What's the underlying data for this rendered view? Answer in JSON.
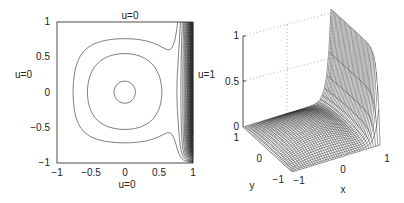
{
  "chart_data": [
    {
      "type": "contour",
      "title": "",
      "xlabel": "",
      "ylabel": "",
      "xlim": [
        -1,
        1
      ],
      "ylim": [
        -1,
        1
      ],
      "xticks": [
        "−1",
        "−0.5",
        "0",
        "0.5",
        "1"
      ],
      "yticks": [
        "−1",
        "−0.5",
        "0",
        "0.5",
        "1"
      ],
      "boundary_labels": {
        "top": "u = 0",
        "bottom": "u = 0",
        "left": "u = 0",
        "right": "u = 1"
      },
      "description": "Contour plot of the solution u(x,y) on [-1,1]^2 with u=1 on the right edge x=1 and u=0 elsewhere; contours crowd along the right and bottom-right boundary layers."
    },
    {
      "type": "surface",
      "title": "",
      "xlabel": "x",
      "ylabel": "y",
      "zlabel": "",
      "xlim": [
        -1,
        1
      ],
      "ylim": [
        -1,
        1
      ],
      "zlim": [
        0,
        1
      ],
      "xticks": [
        "−1",
        "0",
        "1"
      ],
      "yticks": [
        "−1",
        "0",
        "1"
      ],
      "zticks": [
        "0",
        "0.5",
        "1"
      ],
      "grid": true,
      "description": "3D mesh surface of u(x,y): near zero over most of the domain, rising steeply to 1 along x=1 (boundary layer wall)."
    }
  ],
  "labels": {
    "contour": {
      "top": "u=0",
      "bottom": "u=0",
      "left": "u=0",
      "right": "u=1",
      "xticks": [
        "−1",
        "−0.5",
        "0",
        "0.5",
        "1"
      ],
      "yticks": [
        "1",
        "0.5",
        "0",
        "−0.5",
        "−1"
      ]
    },
    "surface": {
      "zticks": [
        "1",
        "0.5",
        "0"
      ],
      "yticks": [
        "1",
        "0",
        "−1"
      ],
      "xticks": [
        "−1",
        "0",
        "1"
      ],
      "xlabel": "x",
      "ylabel": "y"
    }
  }
}
